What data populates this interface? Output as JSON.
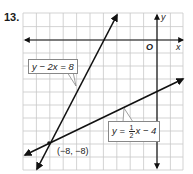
{
  "problem": {
    "number": "13."
  },
  "graph": {
    "x_axis_label": "x",
    "y_axis_label": "y",
    "origin_label": "O",
    "x_range": [
      -10,
      2
    ],
    "y_range": [
      -10,
      2
    ],
    "grid_unit": 1
  },
  "lines": [
    {
      "name": "steep-line",
      "equation": "y − 2x = 8",
      "slope": 2,
      "intercept": 8
    },
    {
      "name": "shallow-line",
      "equation_lhs": "y",
      "equation_eq": "=",
      "fraction_num": "1",
      "fraction_den": "2",
      "equation_rhs": "x − 4",
      "slope": 0.5,
      "intercept": -4
    }
  ],
  "intersection": {
    "label": "(−8, −8)",
    "x": -8,
    "y": -8
  },
  "colors": {
    "grid": "#c8c8c8",
    "axis": "#111111",
    "line": "#111111",
    "label_border": "#888888"
  }
}
